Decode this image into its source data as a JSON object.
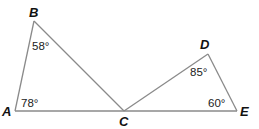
{
  "diagram": {
    "type": "geometry-triangles",
    "vertices": {
      "A": {
        "label": "A"
      },
      "B": {
        "label": "B"
      },
      "C": {
        "label": "C"
      },
      "D": {
        "label": "D"
      },
      "E": {
        "label": "E"
      }
    },
    "triangles": [
      {
        "name": "ABC",
        "vertices": [
          "A",
          "B",
          "C"
        ]
      },
      {
        "name": "CDE",
        "vertices": [
          "C",
          "D",
          "E"
        ]
      }
    ],
    "angles": [
      {
        "vertex": "B",
        "label": "58°"
      },
      {
        "vertex": "A",
        "label": "78°"
      },
      {
        "vertex": "D",
        "label": "85°"
      },
      {
        "vertex": "E",
        "label": "60°"
      }
    ],
    "collinear": [
      "A",
      "C",
      "E"
    ]
  }
}
